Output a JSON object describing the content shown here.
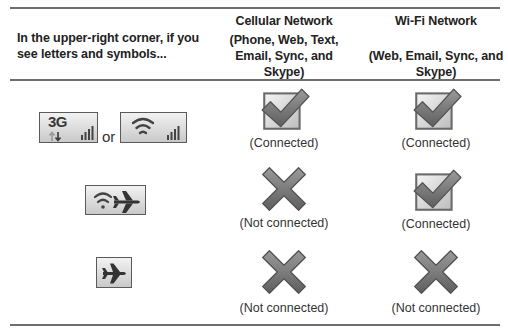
{
  "table": {
    "header": {
      "indicator_col": "In the upper-right corner, if you see letters and symbols...",
      "cellular_col": {
        "title": "Cellular Network",
        "subtitle_line1": "(Phone, Web, Text,",
        "subtitle_line2": "Email, Sync, and",
        "subtitle_line3": "Skype)"
      },
      "wifi_col": {
        "title": "Wi-Fi Network",
        "subtitle_line1": "(Web, Email, Sync, and",
        "subtitle_line2": "Skype)"
      }
    },
    "rows": [
      {
        "indicators": [
          "3g-signal-icon",
          "wifi-signal-icon"
        ],
        "indicator_3g_text": "3G",
        "or_text": "or",
        "cellular": {
          "status": "connected",
          "label": "(Connected)"
        },
        "wifi": {
          "status": "connected",
          "label": "(Connected)"
        }
      },
      {
        "indicators": [
          "wifi-airplane-icon"
        ],
        "cellular": {
          "status": "not-connected",
          "label": "(Not connected)"
        },
        "wifi": {
          "status": "connected",
          "label": "(Connected)"
        }
      },
      {
        "indicators": [
          "airplane-icon"
        ],
        "cellular": {
          "status": "not-connected",
          "label": "(Not connected)"
        },
        "wifi": {
          "status": "not-connected",
          "label": "(Not connected)"
        }
      }
    ]
  },
  "colors": {
    "rule": "#6e6e6e",
    "icon_gray": "#7a7a7a",
    "icon_box_border": "#5a5a5a"
  }
}
